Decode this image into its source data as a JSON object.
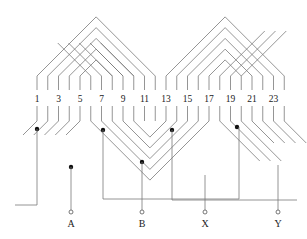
{
  "diagram": {
    "type": "stator winding diagram",
    "slot_count": 24,
    "slot_labels": [
      "1",
      "3",
      "5",
      "7",
      "9",
      "11",
      "13",
      "15",
      "17",
      "19",
      "21",
      "23"
    ],
    "terminals": [
      "A",
      "B",
      "X",
      "Y"
    ],
    "line_color": "#7a7a7a",
    "dot_color": "#111111"
  }
}
